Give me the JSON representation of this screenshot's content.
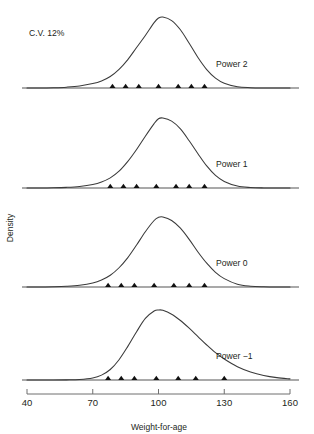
{
  "figure": {
    "annotation": "C.V. 12%",
    "y_axis_label": "Density",
    "x_axis_label": "Weight-for-age"
  },
  "chart_data": {
    "type": "line",
    "title": "",
    "subtitle": "",
    "xlabel": "Weight-for-age",
    "ylabel": "Density",
    "xlim": [
      40,
      160
    ],
    "ylim": [
      0,
      1
    ],
    "grid": false,
    "legend": "none",
    "annotations": [
      {
        "text": "C.V. 12%",
        "x": 48,
        "y": 0.93
      }
    ],
    "panels": [
      {
        "label": "Power 2",
        "power": 2,
        "cv_percent": 12,
        "mode": 100,
        "skew": "left",
        "x": [
          40,
          46,
          52,
          58,
          64,
          70,
          74,
          78,
          82,
          86,
          90,
          94,
          98,
          100,
          102,
          106,
          110,
          114,
          118,
          122,
          126,
          130,
          136,
          142,
          148,
          154,
          160
        ],
        "density": [
          0.0,
          0.0,
          0.004,
          0.012,
          0.028,
          0.062,
          0.1,
          0.162,
          0.262,
          0.4,
          0.57,
          0.74,
          0.92,
          0.985,
          1.0,
          0.95,
          0.82,
          0.63,
          0.43,
          0.26,
          0.14,
          0.068,
          0.018,
          0.004,
          0.0,
          0.0,
          0.0
        ],
        "centile_markers": [
          79,
          85,
          91,
          100,
          109,
          115,
          121
        ]
      },
      {
        "label": "Power 1",
        "power": 1,
        "cv_percent": 12,
        "mode": 100,
        "skew": "none",
        "x": [
          40,
          46,
          52,
          58,
          64,
          70,
          74,
          78,
          82,
          86,
          90,
          94,
          98,
          100,
          102,
          106,
          110,
          114,
          118,
          122,
          126,
          130,
          136,
          142,
          148,
          154,
          160
        ],
        "density": [
          0.0,
          0.0,
          0.003,
          0.009,
          0.022,
          0.05,
          0.086,
          0.145,
          0.24,
          0.38,
          0.55,
          0.74,
          0.92,
          0.99,
          1.0,
          0.955,
          0.845,
          0.675,
          0.49,
          0.315,
          0.18,
          0.094,
          0.028,
          0.007,
          0.001,
          0.0,
          0.0
        ],
        "centile_markers": [
          78,
          84,
          90,
          99,
          108,
          114,
          121
        ]
      },
      {
        "label": "Power 0",
        "power": 0,
        "cv_percent": 12,
        "mode": 99,
        "skew": "slight-right",
        "x": [
          40,
          46,
          52,
          58,
          64,
          70,
          74,
          78,
          82,
          86,
          90,
          94,
          98,
          100,
          102,
          106,
          110,
          114,
          118,
          122,
          126,
          130,
          136,
          142,
          148,
          154,
          160
        ],
        "density": [
          0.0,
          0.001,
          0.004,
          0.011,
          0.026,
          0.058,
          0.1,
          0.168,
          0.275,
          0.42,
          0.6,
          0.79,
          0.95,
          0.995,
          1.0,
          0.95,
          0.84,
          0.68,
          0.5,
          0.34,
          0.21,
          0.12,
          0.04,
          0.012,
          0.003,
          0.0,
          0.0
        ],
        "centile_markers": [
          77,
          83,
          89,
          98,
          107,
          114,
          121
        ]
      },
      {
        "label": "Power −1",
        "power": -1,
        "cv_percent": 12,
        "mode": 99,
        "skew": "right",
        "x": [
          40,
          46,
          52,
          58,
          64,
          70,
          74,
          78,
          82,
          86,
          90,
          94,
          98,
          100,
          102,
          106,
          110,
          114,
          118,
          122,
          126,
          130,
          136,
          142,
          148,
          154,
          160
        ],
        "density": [
          0.0,
          0.0,
          0.0,
          0.002,
          0.008,
          0.03,
          0.07,
          0.15,
          0.29,
          0.48,
          0.69,
          0.88,
          0.985,
          1.0,
          0.995,
          0.94,
          0.85,
          0.74,
          0.62,
          0.5,
          0.39,
          0.3,
          0.19,
          0.115,
          0.065,
          0.034,
          0.016
        ],
        "centile_markers": [
          77,
          83,
          89,
          99,
          109,
          117,
          130
        ]
      }
    ],
    "xticks": [
      {
        "value": 40,
        "label": "40"
      },
      {
        "value": 70,
        "label": "70"
      },
      {
        "value": 100,
        "label": "100"
      },
      {
        "value": 130,
        "label": "130"
      },
      {
        "value": 160,
        "label": "160"
      }
    ]
  },
  "colors": {
    "curve": "#3a3a3a",
    "baseline": "#555555",
    "marker": "#111111",
    "axis": "#6f6f6f",
    "text": "#231f20",
    "background": "#ffffff"
  }
}
